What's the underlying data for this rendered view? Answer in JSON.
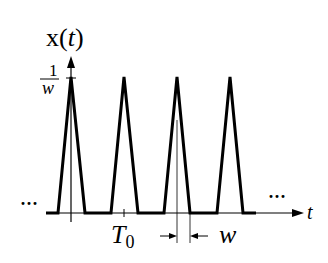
{
  "diagram": {
    "y_axis_label_main": "x",
    "y_axis_label_paren_open": "(",
    "y_axis_label_var": "t",
    "y_axis_label_paren_close": ")",
    "peak_label_numerator": "1",
    "peak_label_denominator": "w",
    "x_axis_label": "t",
    "period_label_main": "T",
    "period_label_sub": "0",
    "width_label": "w",
    "left_ellipsis": "···",
    "right_ellipsis": "···",
    "pulses": [
      {
        "center_x": 71,
        "left_x": 58,
        "right_x": 85
      },
      {
        "center_x": 124,
        "left_x": 111,
        "right_x": 138
      },
      {
        "center_x": 177,
        "left_x": 164,
        "right_x": 190
      },
      {
        "center_x": 230,
        "left_x": 217,
        "right_x": 243
      }
    ],
    "colors": {
      "line": "#000000",
      "background": "#ffffff"
    }
  }
}
